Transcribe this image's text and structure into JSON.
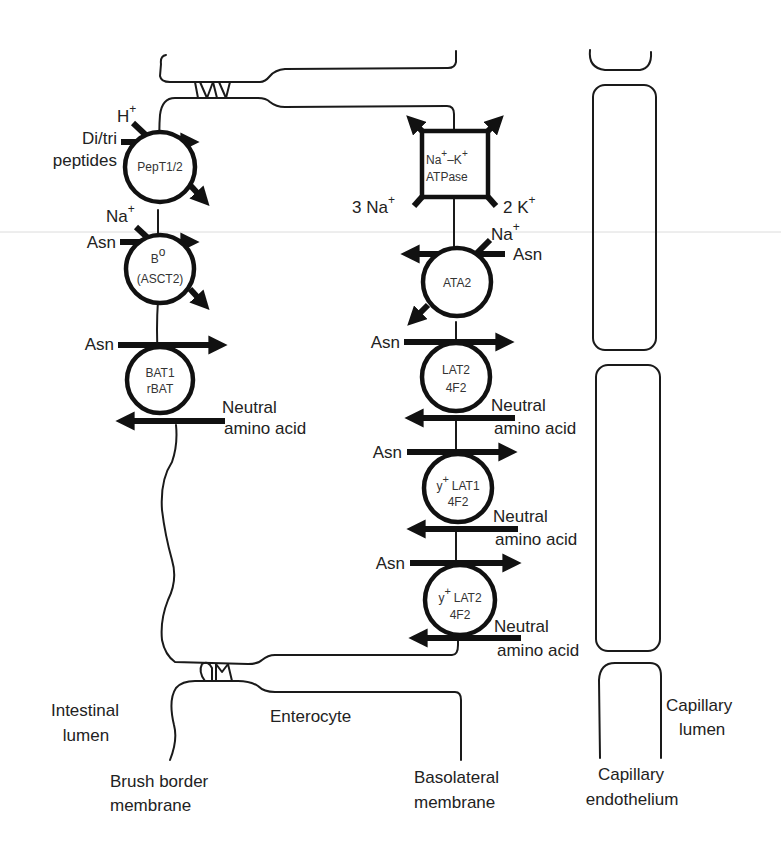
{
  "figure": {
    "type": "transport-diagram"
  },
  "regions": {
    "intestinal_lumen": "Intestinal\nlumen",
    "enterocyte": "Enterocyte",
    "brush_border": "Brush border\nmembrane",
    "basolateral": "Basolateral\nmembrane",
    "capillary_endothelium": "Capillary\nendothelium",
    "capillary_lumen": "Capillary\nlumen"
  },
  "apical_transporters": [
    {
      "id": "pept",
      "name_lines": [
        "PepT1/2"
      ],
      "substrates": [
        "Di/tri peptides",
        "H+"
      ]
    },
    {
      "id": "b0",
      "name_lines": [
        "B",
        "(ASCT2)"
      ],
      "name_sup": "o",
      "substrates": [
        "Asn",
        "Na+"
      ]
    },
    {
      "id": "bat1",
      "name_lines": [
        "BAT1",
        "rBAT"
      ],
      "substrates": [
        "Asn",
        "Neutral amino acid"
      ]
    }
  ],
  "basolateral_transporters": [
    {
      "id": "atpase",
      "name_lines": [
        "Na+–K+",
        "ATPase"
      ],
      "substrates": [
        "3 Na+",
        "2 K+"
      ]
    },
    {
      "id": "ata2",
      "name_lines": [
        "ATA2"
      ],
      "substrates": [
        "Na+",
        "Asn"
      ]
    },
    {
      "id": "lat2",
      "name_lines": [
        "LAT2",
        "4F2"
      ],
      "substrates": [
        "Asn",
        "Neutral amino acid"
      ]
    },
    {
      "id": "y_lat1",
      "name_lines": [
        "y+ LAT1",
        "4F2"
      ],
      "substrates": [
        "Asn",
        "Neutral amino acid"
      ]
    },
    {
      "id": "y_lat2",
      "name_lines": [
        "y+ LAT2",
        "4F2"
      ],
      "substrates": [
        "Asn",
        "Neutral amino acid"
      ]
    }
  ],
  "labels": {
    "h": "H",
    "plus": "+",
    "ditri_1": "Di/tri",
    "ditri_2": "peptides",
    "na": "Na",
    "asn": "Asn",
    "neutral": "Neutral",
    "amino_acid": "amino acid",
    "three_na": "3 Na",
    "two_k": "2 K",
    "pept_name": "PepT1/2",
    "b0_name": "B",
    "b0_sup": "o",
    "b0_name2": "(ASCT2)",
    "bat1_name1": "BAT1",
    "bat1_name2": "rBAT",
    "atp_na": "Na",
    "atp_dash_k": "–K",
    "atp_name2": "ATPase",
    "ata2_name": "ATA2",
    "lat2_name1": "LAT2",
    "lat2_name2": "4F2",
    "y": "y",
    "lat1": "LAT1",
    "lat2": "LAT2",
    "f2": "4F2",
    "intestinal": "Intestinal",
    "lumen": "lumen",
    "enterocyte": "Enterocyte",
    "brush": "Brush border",
    "membrane": "membrane",
    "basolateral": "Basolateral",
    "capillary": "Capillary",
    "endothelium": "endothelium"
  }
}
